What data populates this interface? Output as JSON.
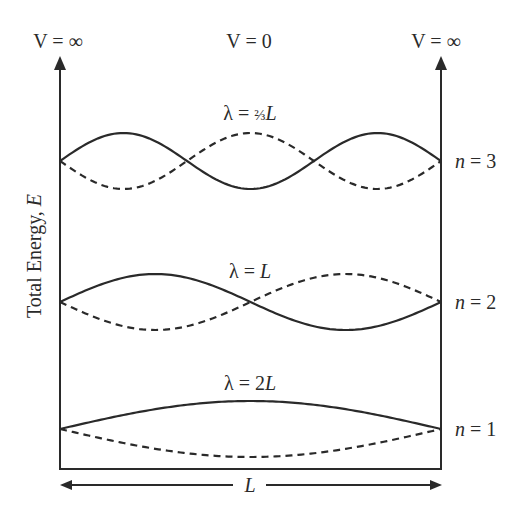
{
  "diagram": {
    "potential_labels": {
      "left": "V = ∞",
      "center": "V = 0",
      "right": "V = ∞"
    },
    "y_axis_label": "Total Energy, ",
    "y_axis_label_var": "E",
    "box_width_label": "L",
    "colors": {
      "line": "#2a2a2a",
      "background": "#ffffff"
    },
    "levels": [
      {
        "n_label": "n",
        "n_eq": " = 3",
        "n": 3,
        "wavelength_label": "λ = ⅔L",
        "lambda_prefix": "λ = ",
        "lambda_value": "⅔",
        "lambda_var": "L"
      },
      {
        "n_label": "n",
        "n_eq": " = 2",
        "n": 2,
        "wavelength_label": "λ = L",
        "lambda_prefix": "λ = ",
        "lambda_value": "",
        "lambda_var": "L"
      },
      {
        "n_label": "n",
        "n_eq": " = 1",
        "n": 1,
        "wavelength_label": "λ = 2L",
        "lambda_prefix": "λ = ",
        "lambda_value": "2",
        "lambda_var": "L"
      }
    ]
  },
  "chart_data": {
    "type": "line",
    "xlabel": "L",
    "ylabel": "Total Energy, E",
    "x_range": [
      0,
      1
    ],
    "series": [
      {
        "name": "n = 3 (solid)",
        "n": 3,
        "function": "sin(3πx/L)",
        "style": "solid",
        "wavelength": "2/3 L"
      },
      {
        "name": "n = 3 (dashed)",
        "n": 3,
        "function": "-sin(3πx/L)",
        "style": "dashed",
        "wavelength": "2/3 L"
      },
      {
        "name": "n = 2 (solid)",
        "n": 2,
        "function": "sin(2πx/L)",
        "style": "solid",
        "wavelength": "L"
      },
      {
        "name": "n = 2 (dashed)",
        "n": 2,
        "function": "-sin(2πx/L)",
        "style": "dashed",
        "wavelength": "L"
      },
      {
        "name": "n = 1 (solid)",
        "n": 1,
        "function": "sin(πx/L)",
        "style": "solid",
        "wavelength": "2L"
      },
      {
        "name": "n = 1 (dashed)",
        "n": 1,
        "function": "-sin(πx/L)",
        "style": "dashed",
        "wavelength": "2L"
      }
    ],
    "annotations": [
      "V = ∞",
      "V = 0",
      "V = ∞",
      "λ = ⅔L",
      "λ = L",
      "λ = 2L",
      "n = 3",
      "n = 2",
      "n = 1"
    ],
    "grid": false,
    "legend": "none"
  }
}
